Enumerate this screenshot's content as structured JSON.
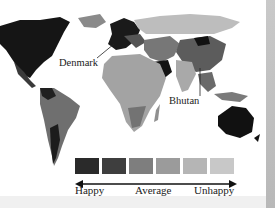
{
  "map": {
    "title": "World happiness map",
    "annotations": [
      {
        "label": "Denmark"
      },
      {
        "label": "Bhutan"
      }
    ]
  },
  "legend": {
    "colors": [
      "#2a2a2a",
      "#3e3e3e",
      "#7e7e7e",
      "#9b9b9b",
      "#b5b5b5",
      "#c8c8c8"
    ],
    "labels": {
      "left": "Happy",
      "middle": "Average",
      "right": "Unhappy"
    }
  }
}
